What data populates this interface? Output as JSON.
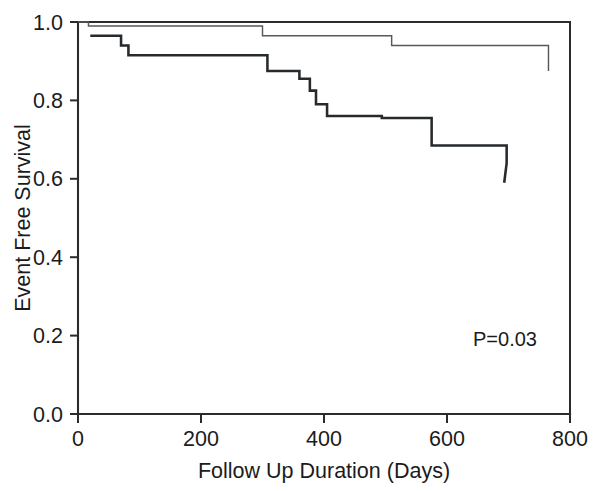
{
  "chart_data": {
    "type": "line",
    "subtype": "kaplan-meier-step",
    "title": "",
    "xlabel": "Follow Up Duration (Days)",
    "ylabel": "Event Free Survival",
    "xlim": [
      0,
      800
    ],
    "ylim": [
      0.0,
      1.0
    ],
    "xticks": [
      0,
      200,
      400,
      600,
      800
    ],
    "xtick_labels": [
      "0",
      "200",
      "400",
      "600",
      "800"
    ],
    "yticks": [
      0.0,
      0.2,
      0.4,
      0.6,
      0.8,
      1.0
    ],
    "ytick_labels": [
      "0.0",
      "0.2",
      "0.4",
      "0.6",
      "0.8",
      "1.0"
    ],
    "grid": false,
    "legend": null,
    "annotations": [
      {
        "text": "P=0.03",
        "x": 645,
        "y": 0.22
      }
    ],
    "series": [
      {
        "name": "upper-curve",
        "style": "thin",
        "color": "#555a5d",
        "x": [
          0,
          17,
          17,
          300,
          300,
          510,
          510,
          765,
          765
        ],
        "y": [
          1.0,
          1.0,
          0.99,
          0.99,
          0.965,
          0.965,
          0.94,
          0.94,
          0.875
        ]
      },
      {
        "name": "lower-curve",
        "style": "thick",
        "color": "#262a2c",
        "x": [
          20,
          70,
          70,
          82,
          82,
          263,
          263,
          308,
          308,
          360,
          360,
          377,
          377,
          387,
          387,
          405,
          405,
          494,
          494,
          575,
          575,
          697,
          697,
          693
        ],
        "y": [
          0.965,
          0.965,
          0.94,
          0.94,
          0.915,
          0.915,
          0.915,
          0.915,
          0.875,
          0.875,
          0.855,
          0.855,
          0.825,
          0.825,
          0.79,
          0.79,
          0.76,
          0.76,
          0.755,
          0.755,
          0.685,
          0.685,
          0.64,
          0.59
        ]
      }
    ]
  },
  "axes": {
    "x_title": "Follow Up Duration (Days)",
    "y_title": "Event Free Survival"
  },
  "annotation": {
    "p_value": "P=0.03"
  },
  "colors": {
    "axis": "#2b2b2b",
    "thin_curve": "#555a5d",
    "thick_curve": "#262a2c",
    "background": "#ffffff"
  }
}
